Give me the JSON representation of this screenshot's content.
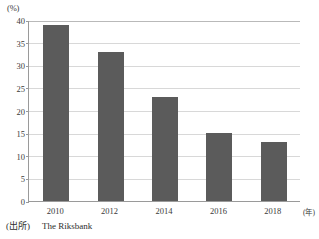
{
  "chart_data": {
    "type": "bar",
    "title": "",
    "xlabel": "(年)",
    "ylabel": "(%)",
    "categories": [
      "2010",
      "2012",
      "2014",
      "2016",
      "2018"
    ],
    "values": [
      39,
      33,
      23,
      15,
      13
    ],
    "ylim": [
      0,
      40
    ],
    "y_ticks": [
      0,
      5,
      10,
      15,
      20,
      25,
      30,
      35,
      40
    ],
    "y_tick_labels": [
      "0",
      "5",
      "10",
      "15",
      "20",
      "25",
      "30",
      "35",
      "40"
    ],
    "grid": true,
    "legend": false,
    "bar_color": "#5b5b5b",
    "series": [
      {
        "name": "",
        "values": [
          39,
          33,
          23,
          15,
          13
        ]
      }
    ]
  },
  "axis": {
    "y_unit": "(%)",
    "x_unit": "(年)"
  },
  "source": {
    "label": "(出所)",
    "text": "The Riksbank"
  }
}
